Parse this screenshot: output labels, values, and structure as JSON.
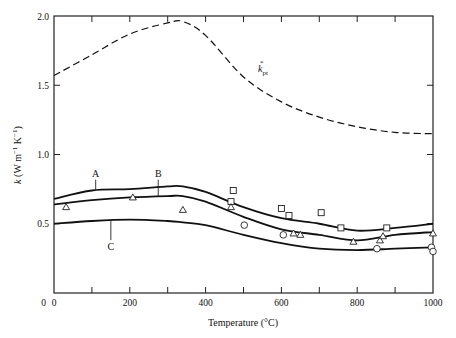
{
  "chart_data": {
    "type": "line",
    "title": "",
    "xlabel": "Temperature (°C)",
    "ylabel": "k (W m⁻¹ K⁻¹)",
    "xlim": [
      0,
      1000
    ],
    "ylim": [
      0,
      2.0
    ],
    "grid": false,
    "x_ticks": [
      0,
      200,
      400,
      600,
      800,
      1000
    ],
    "x_minor_ticks": [
      100,
      300,
      500,
      700,
      900
    ],
    "y_ticks": [
      0,
      0.5,
      1.0,
      1.5,
      2.0
    ],
    "y_tick_labels": [
      "0",
      "0.5",
      "1.0",
      "1.5",
      "2.0"
    ],
    "x": [
      0,
      100,
      200,
      300,
      340,
      400,
      500,
      600,
      700,
      800,
      900,
      1000
    ],
    "series": [
      {
        "name": "k*pt",
        "label": "k",
        "label_sub": "pt",
        "label_sup": "*",
        "style": "dashed",
        "values": [
          1.57,
          1.72,
          1.87,
          1.95,
          1.96,
          1.86,
          1.56,
          1.38,
          1.27,
          1.2,
          1.16,
          1.15
        ]
      },
      {
        "name": "A",
        "style": "solid",
        "values": [
          0.68,
          0.74,
          0.75,
          0.77,
          0.77,
          0.73,
          0.62,
          0.54,
          0.5,
          0.45,
          0.47,
          0.5
        ]
      },
      {
        "name": "B",
        "style": "solid",
        "values": [
          0.64,
          0.67,
          0.69,
          0.7,
          0.7,
          0.66,
          0.55,
          0.46,
          0.42,
          0.38,
          0.42,
          0.44
        ]
      },
      {
        "name": "C",
        "style": "solid",
        "values": [
          0.5,
          0.52,
          0.53,
          0.52,
          0.51,
          0.49,
          0.42,
          0.36,
          0.32,
          0.31,
          0.32,
          0.33
        ]
      }
    ],
    "scatter": {
      "squares": [
        [
          473,
          0.74
        ],
        [
          467,
          0.66
        ],
        [
          600,
          0.61
        ],
        [
          620,
          0.56
        ],
        [
          705,
          0.58
        ],
        [
          757,
          0.47
        ],
        [
          878,
          0.47
        ]
      ],
      "triangles": [
        [
          32,
          0.62
        ],
        [
          208,
          0.69
        ],
        [
          340,
          0.6
        ],
        [
          467,
          0.62
        ],
        [
          632,
          0.43
        ],
        [
          650,
          0.42
        ],
        [
          790,
          0.37
        ],
        [
          860,
          0.38
        ],
        [
          868,
          0.41
        ],
        [
          1000,
          0.43
        ]
      ],
      "circles": [
        [
          502,
          0.49
        ],
        [
          605,
          0.42
        ],
        [
          852,
          0.32
        ],
        [
          996,
          0.33
        ],
        [
          1000,
          0.3
        ]
      ]
    },
    "annotations": [
      {
        "text": "A",
        "x": 110,
        "y": 0.84
      },
      {
        "text": "B",
        "x": 275,
        "y": 0.84
      },
      {
        "text": "C",
        "x": 150,
        "y": 0.31
      }
    ]
  },
  "labels": {
    "xlabel": "Temperature (°C)",
    "ylabel_k": "k",
    "ylabel_units": " (W m",
    "ylabel_exp1": "−1",
    "ylabel_k2": " K",
    "ylabel_exp2": "−1",
    "ylabel_close": ")",
    "kpt_k": "k",
    "kpt_sub": "pt",
    "kpt_sup": "*"
  }
}
